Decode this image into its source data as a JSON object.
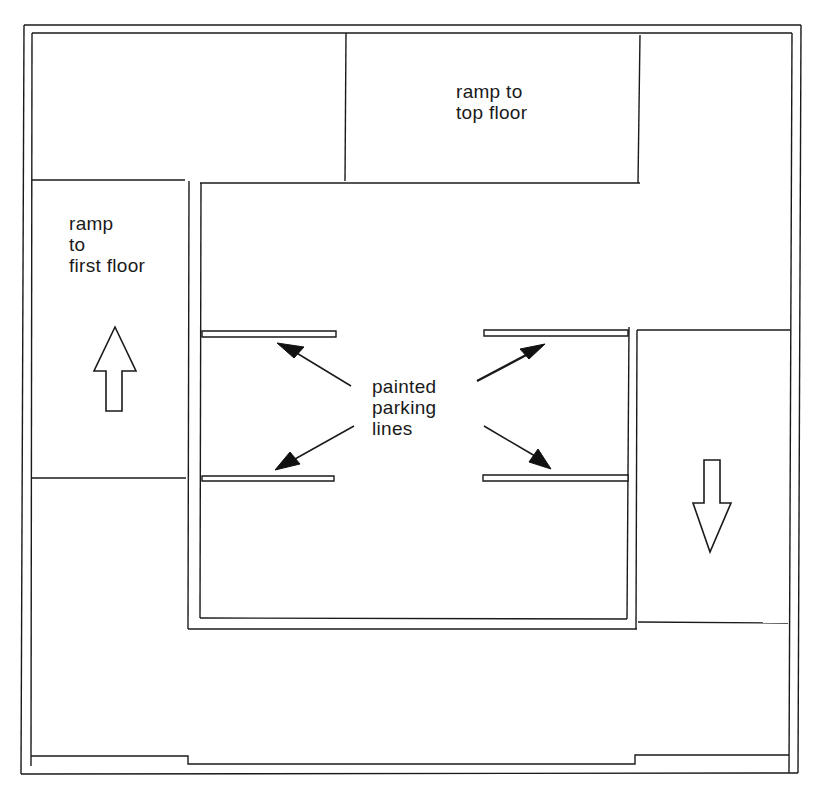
{
  "diagram": {
    "type": "floor-plan",
    "colors": {
      "line": "#1a1a1a",
      "background": "#ffffff"
    },
    "labels": {
      "ramp_top": {
        "line1": "ramp to",
        "line2": "top floor"
      },
      "ramp_first": {
        "line1": "ramp",
        "line2": "to",
        "line3": "first floor"
      },
      "parking_lines": {
        "line1": "painted",
        "line2": "parking",
        "line3": "lines"
      }
    },
    "direction_arrows": [
      {
        "name": "up-arrow",
        "direction": "up",
        "zone": "ramp to first floor"
      },
      {
        "name": "down-arrow",
        "direction": "down",
        "zone": "right lane"
      }
    ],
    "pointer_arrows": [
      {
        "target": "top-left parking line"
      },
      {
        "target": "top-right parking line"
      },
      {
        "target": "bottom-left parking line"
      },
      {
        "target": "bottom-right parking line"
      }
    ]
  }
}
